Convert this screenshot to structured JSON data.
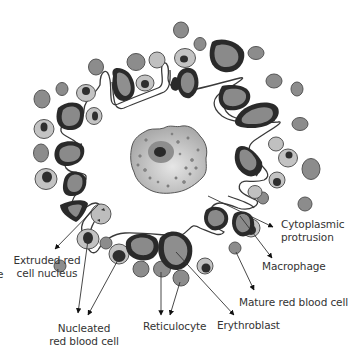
{
  "diagram": {
    "colors": {
      "background": "#ffffff",
      "outline": "#333333",
      "mature_rbc": "#8c8c8c",
      "reticulocyte_fill": "#bdbdbd",
      "nucleus": "#2b2b2b",
      "erythroblast_rim": "#2a2a2a",
      "erythroblast_fill": "#8a8a8a",
      "macrophage_fill": "#b9b9b9",
      "label_text": "#333333"
    },
    "labels": {
      "extruded_nucleus": {
        "line1": "Extruded red",
        "line2": "cell nucleus"
      },
      "nucleated_rbc": {
        "line1": "Nucleated",
        "line2": "red blood cell"
      },
      "reticulocyte": "Reticulocyte",
      "erythroblast": "Erythroblast",
      "mature_rbc": "Mature red blood cell",
      "macrophage": "Macrophage",
      "cytoplasmic_protrusion": {
        "line1": "Cytoplasmic",
        "line2": "protrusion"
      },
      "cut_edge_char": "e"
    }
  }
}
